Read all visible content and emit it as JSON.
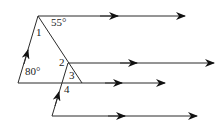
{
  "diagram": {
    "colors": {
      "stroke": "#2b2b2b",
      "arrow": "#111111",
      "background": "#ffffff"
    },
    "labels": {
      "angle_55": "55°",
      "angle_80": "80°",
      "angle_1": "1",
      "angle_2": "2",
      "angle_3": "3",
      "angle_4": "4"
    },
    "lines": [
      {
        "name": "top-ray",
        "from": [
          38,
          16
        ],
        "to": [
          185,
          16
        ],
        "mid_arrow_x": 118
      },
      {
        "name": "second-ray",
        "from": [
          68,
          63
        ],
        "to": [
          214,
          63
        ],
        "mid_arrow_x": 137
      },
      {
        "name": "third-ray",
        "from": [
          18,
          83
        ],
        "to": [
          165,
          83
        ],
        "mid_arrow_x": 122
      },
      {
        "name": "bottom-ray",
        "from": [
          52,
          116
        ],
        "to": [
          197,
          116
        ],
        "mid_arrow_x": 125
      }
    ]
  }
}
